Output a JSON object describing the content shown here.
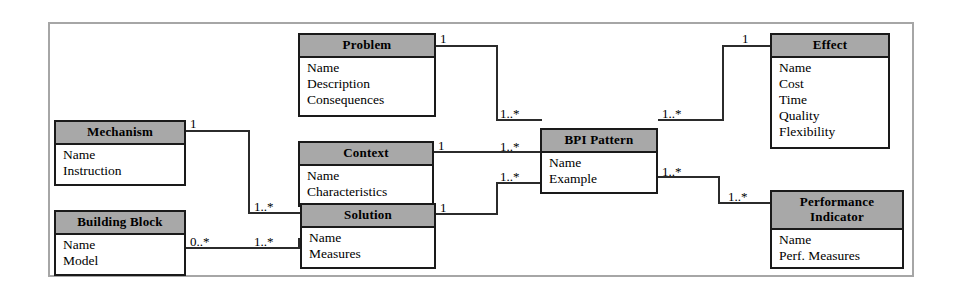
{
  "figure": {
    "kind": "uml-class-diagram",
    "frame_border_color": "#a6a6a6",
    "class_header_fill": "#a8a8a8",
    "line_color": "#2b2b2b",
    "background": "#ffffff"
  },
  "classes": {
    "problem": {
      "title": "Problem",
      "attributes": [
        "Name",
        "Description",
        "Consequences"
      ]
    },
    "mechanism": {
      "title": "Mechanism",
      "attributes": [
        "Name",
        "Instruction"
      ]
    },
    "context": {
      "title": "Context",
      "attributes": [
        "Name",
        "Characteristics"
      ]
    },
    "building_block": {
      "title": "Building Block",
      "attributes": [
        "Name",
        "Model"
      ]
    },
    "solution": {
      "title": "Solution",
      "attributes": [
        "Name",
        "Measures"
      ]
    },
    "bpi_pattern": {
      "title": "BPI Pattern",
      "attributes": [
        "Name",
        "Example"
      ]
    },
    "effect": {
      "title": "Effect",
      "attributes": [
        "Name",
        "Cost",
        "Time",
        "Quality",
        "Flexibility"
      ]
    },
    "performance_indicator": {
      "title_line1": "Performance",
      "title_line2": "Indicator",
      "attributes": [
        "Name",
        "Perf. Measures"
      ]
    }
  },
  "multiplicities": {
    "problem_end": "1",
    "mechanism_end": "1",
    "context_end": "1",
    "solution_end": "1",
    "building_block_end": "0..*",
    "mechanism_to_solution": "1..*",
    "building_block_to_solution": "1..*",
    "problem_to_pattern": "1..*",
    "context_to_pattern": "1..*",
    "solution_to_pattern": "1..*",
    "pattern_to_effect": "1..*",
    "pattern_to_indicator": "1..*",
    "effect_end": "1",
    "indicator_end": "1..*"
  }
}
